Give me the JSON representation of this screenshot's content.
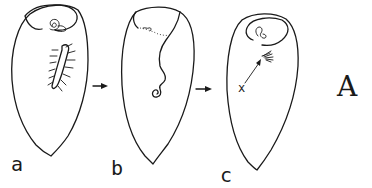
{
  "figure": {
    "panel_label": "A",
    "cells": [
      {
        "id": "a",
        "label": "a"
      },
      {
        "id": "b",
        "label": "b"
      },
      {
        "id": "c",
        "label": "c"
      }
    ],
    "marker_label": "x",
    "arrows": [
      "a-to-b",
      "b-to-c"
    ],
    "colors": {
      "ink": "#1a1a1a",
      "background": "#ffffff"
    }
  }
}
